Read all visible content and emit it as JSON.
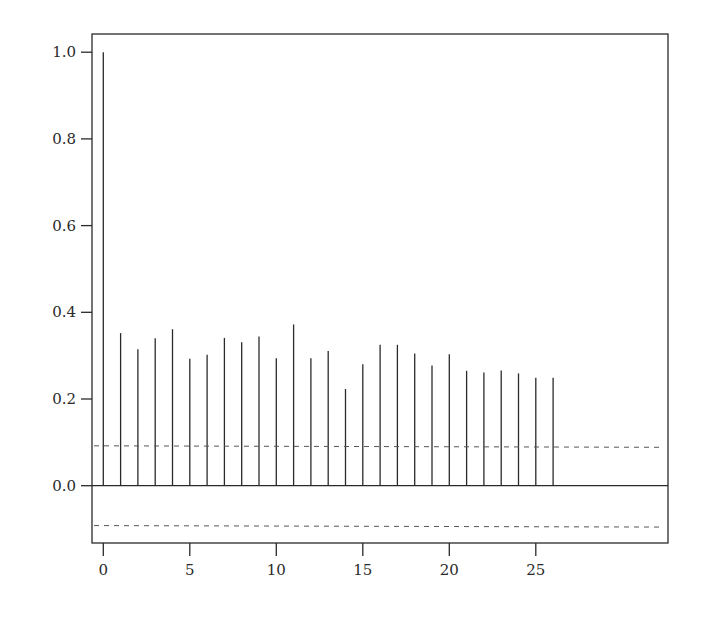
{
  "chart_data": {
    "type": "bar",
    "subtype": "acf-stem",
    "title": "",
    "xlabel": "",
    "ylabel": "",
    "x": [
      0,
      1,
      2,
      3,
      4,
      5,
      6,
      7,
      8,
      9,
      10,
      11,
      12,
      13,
      14,
      15,
      16,
      17,
      18,
      19,
      20,
      21,
      22,
      23,
      24,
      25,
      26
    ],
    "values": [
      1.0,
      0.352,
      0.315,
      0.34,
      0.361,
      0.293,
      0.302,
      0.341,
      0.331,
      0.344,
      0.294,
      0.372,
      0.294,
      0.311,
      0.223,
      0.28,
      0.325,
      0.325,
      0.305,
      0.277,
      0.303,
      0.265,
      0.261,
      0.266,
      0.259,
      0.249,
      0.249
    ],
    "confidence_band": {
      "upper": 0.092,
      "lower": -0.092,
      "style": "dashed"
    },
    "xlim": [
      -1.5,
      27
    ],
    "ylim": [
      -0.13,
      1.04
    ],
    "xticks": [
      0,
      5,
      10,
      15,
      20,
      25
    ],
    "xtick_labels": [
      "0",
      "5",
      "10",
      "15",
      "20",
      "25"
    ],
    "yticks": [
      0.0,
      0.2,
      0.4,
      0.6,
      0.8,
      1.0
    ],
    "ytick_labels": [
      "0.0",
      "0.2",
      "0.4",
      "0.6",
      "0.8",
      "1.0"
    ],
    "grid": false,
    "legend": null,
    "colors": {
      "stem": "#2a2a2a",
      "axis": "#2a2a2a",
      "band": "#555555"
    }
  }
}
